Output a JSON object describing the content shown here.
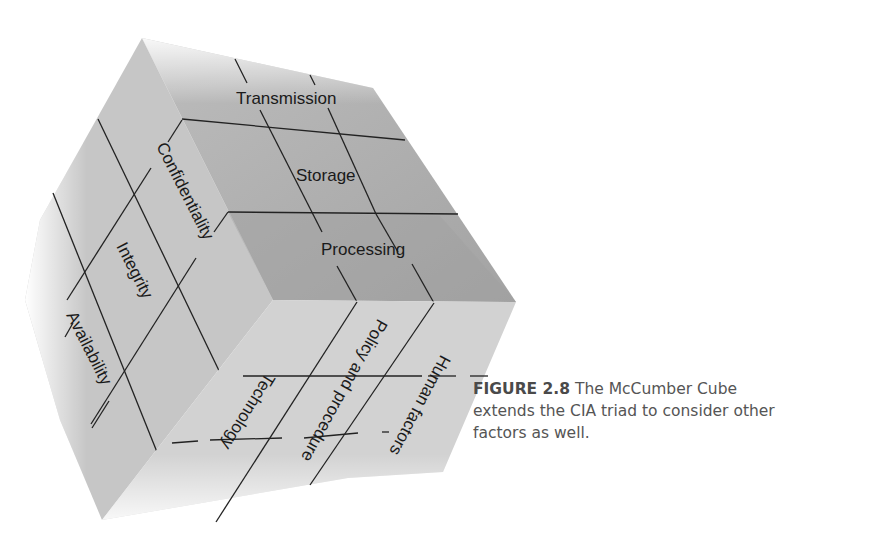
{
  "figure": {
    "title": "The McCumber Cube",
    "caption": {
      "label": "FIGURE 2.8",
      "text_line1": " The McCumber Cube",
      "text_line2": "extends the CIA triad to consider other",
      "text_line3": "factors as well."
    }
  },
  "cube": {
    "left_face": {
      "name": "Security goals",
      "labels": [
        "Confidentiality",
        "Integrity",
        "Availability"
      ],
      "color": "#c9c9c9"
    },
    "top_face": {
      "name": "Information states",
      "labels": [
        "Transmission",
        "Storage",
        "Processing"
      ],
      "color": "#a9a9a9"
    },
    "bottom_face": {
      "name": "Safeguards",
      "labels": [
        "Technology",
        "Policy and procedure",
        "Human factors"
      ],
      "color": "#d3d3d3"
    }
  }
}
